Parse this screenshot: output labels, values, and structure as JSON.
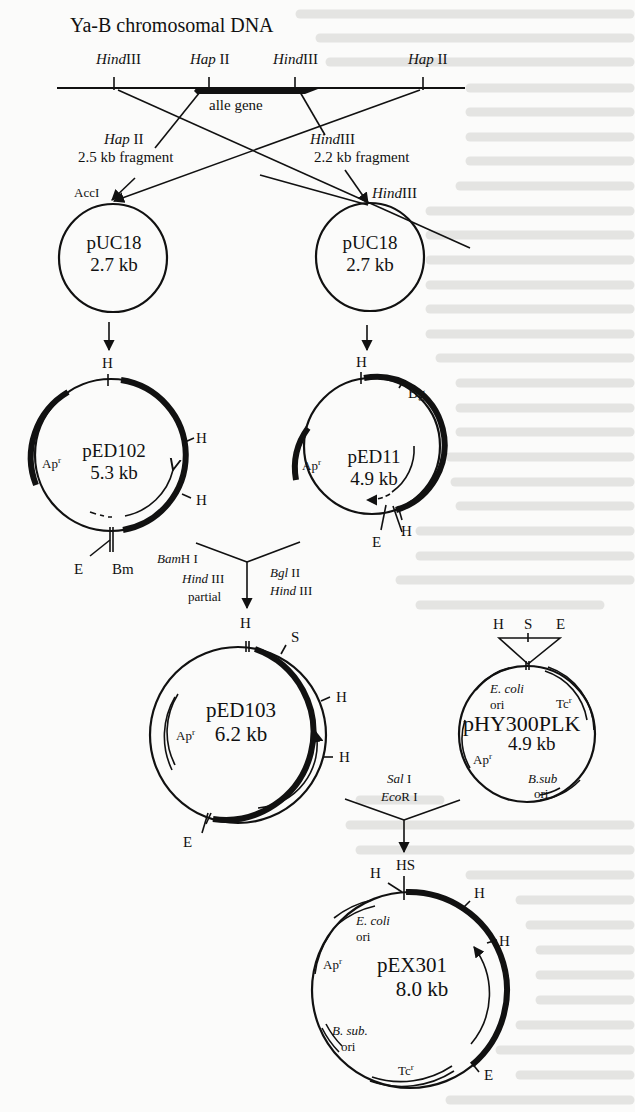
{
  "figure": {
    "title": "Ya-B chromosomal DNA",
    "chromosome": {
      "sites": [
        {
          "enzyme_italic": "Hind",
          "enzyme_roman": "III"
        },
        {
          "enzyme_italic": "Hap",
          "enzyme_roman": "II"
        },
        {
          "enzyme_italic": "Hind",
          "enzyme_roman": "III"
        },
        {
          "enzyme_italic": "Hap",
          "enzyme_roman": "II"
        }
      ],
      "gene_label": "alle gene"
    },
    "fragments": {
      "left": {
        "enzyme_italic": "Hap",
        "enzyme_roman": "II",
        "size": "2.5 kb fragment",
        "target_site": "AccI"
      },
      "right": {
        "enzyme_italic": "Hind",
        "enzyme_roman": "III",
        "size": "2.2 kb fragment",
        "target_site_italic": "Hind",
        "target_site_roman": "III"
      }
    },
    "plasmids": {
      "puc18_left": {
        "name": "pUC18",
        "size": "2.7 kb"
      },
      "puc18_right": {
        "name": "pUC18",
        "size": "2.7 kb"
      },
      "ped102": {
        "name": "pED102",
        "size": "5.3 kb",
        "marker": "Ap",
        "marker_sup": "r",
        "sites": {
          "top": "H",
          "right1": "H",
          "right2": "H",
          "bottom_left": "E",
          "bottom": "Bm"
        }
      },
      "ped11": {
        "name": "pED11",
        "size": "4.9 kb",
        "marker": "Ap",
        "marker_sup": "r",
        "sites": {
          "top": "H",
          "upper_right": "Bg",
          "bottom_e": "E",
          "bottom_h": "H"
        }
      },
      "ped103": {
        "name": "pED103",
        "size": "6.2 kb",
        "marker": "Ap",
        "marker_sup": "r",
        "sites": {
          "top": "H",
          "upper_right": "S",
          "right1": "H",
          "right2": "H",
          "bottom_left": "E"
        }
      },
      "phy300plk": {
        "name": "pHY300PLK",
        "size": "4.9 kb",
        "mcs": {
          "left": "H",
          "middle": "S",
          "right": "E"
        },
        "ecoli_ori_italic": "E. coli",
        "ori": "ori",
        "tc": "Tc",
        "tc_sup": "r",
        "ap": "Ap",
        "ap_sup": "r",
        "bsub_italic": "B.sub",
        "bsub_ori": "ori"
      },
      "pex301": {
        "name": "pEX301",
        "size": "8.0 kb",
        "sites": {
          "top_hs": "HS",
          "top_left_h": "H",
          "right1": "H",
          "right2": "H",
          "bottom_right": "E"
        },
        "ecoli_ori_italic": "E. coli",
        "ori": "ori",
        "ap": "Ap",
        "ap_sup": "r",
        "bsub_italic": "B. sub.",
        "bsub_ori": "ori",
        "tc": "Tc",
        "tc_sup": "r"
      }
    },
    "steps": {
      "ped102_enzymes": {
        "line1_italic": "Bam",
        "line1_roman": "H I",
        "line2_italic": "Hind",
        "line2_roman": "III",
        "line3": "partial"
      },
      "ped11_enzymes": {
        "line1_italic": "Bgl",
        "line1_roman": "II",
        "line2_italic": "Hind",
        "line2_roman": "III"
      },
      "ped103_phy_enzymes": {
        "line1_italic": "Sal",
        "line1_roman": "I",
        "line2_italic": "Eco",
        "line2_roman": "R I"
      }
    },
    "colors": {
      "ink": "#111111",
      "paper": "#fbfbfa",
      "bleed": "#e4e4e2"
    }
  }
}
